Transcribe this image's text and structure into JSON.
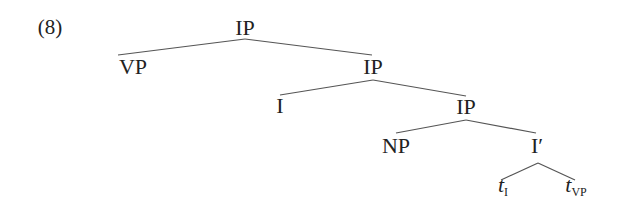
{
  "example_number": "(8)",
  "tree": {
    "type": "syntax-tree",
    "line_color": "#555555",
    "nodes": [
      {
        "id": "n1",
        "label": "IP",
        "x": 245,
        "y": 17
      },
      {
        "id": "n2",
        "label": "VP",
        "x": 133,
        "y": 56,
        "parent": "n1"
      },
      {
        "id": "n3",
        "label": "IP",
        "x": 373,
        "y": 56,
        "parent": "n1"
      },
      {
        "id": "n4",
        "label": "I",
        "x": 280,
        "y": 95,
        "parent": "n3"
      },
      {
        "id": "n5",
        "label": "IP",
        "x": 466,
        "y": 96,
        "parent": "n3"
      },
      {
        "id": "n6",
        "label": "NP",
        "x": 396,
        "y": 135,
        "parent": "n5"
      },
      {
        "id": "n7",
        "label": "I′",
        "x": 535,
        "y": 135,
        "parent": "n5"
      },
      {
        "id": "n8",
        "label": "t",
        "sub": "I",
        "x": 502,
        "y": 174,
        "parent": "n7"
      },
      {
        "id": "n9",
        "label": "t",
        "sub": "VP",
        "x": 572,
        "y": 174,
        "parent": "n7"
      }
    ]
  }
}
